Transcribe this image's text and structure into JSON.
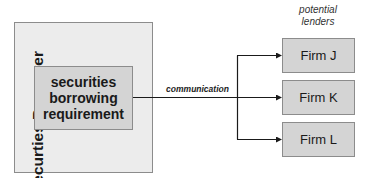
{
  "diagram": {
    "borrower": {
      "label": "Securties Borrower",
      "requirement_lines": [
        "securities",
        "borrowing",
        "requirement"
      ]
    },
    "connector": {
      "label": "communication"
    },
    "lenders": {
      "heading_lines": [
        "potential",
        "lenders"
      ],
      "firms": [
        {
          "label": "Firm J"
        },
        {
          "label": "Firm K"
        },
        {
          "label": "Firm L"
        }
      ]
    },
    "colors": {
      "outer_fill": "#ececec",
      "box_fill": "#d4d4d4",
      "border": "#8c8c8c",
      "line": "#1a1a1a"
    }
  }
}
